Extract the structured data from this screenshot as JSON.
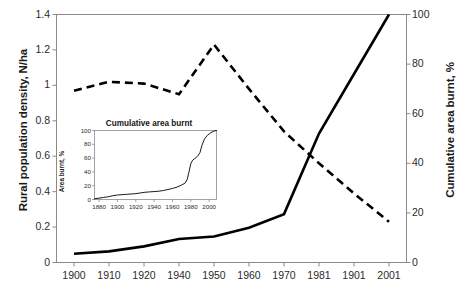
{
  "chart_data": [
    {
      "id": "main",
      "type": "line",
      "title": "",
      "xlabel": "",
      "grid": false,
      "legend": "none",
      "categories": [
        "1900",
        "1910",
        "1920",
        "1940",
        "1950",
        "1960",
        "1970",
        "1981",
        "1901",
        "2001"
      ],
      "axes": {
        "left": {
          "label": "Rural population density, N/ha",
          "ticks": [
            "0",
            "0.2",
            "0.4",
            "0.6",
            "0.8",
            "1",
            "1.2",
            "1.4"
          ],
          "tick_values": [
            0,
            0.2,
            0.4,
            0.6,
            0.8,
            1.0,
            1.2,
            1.4
          ],
          "ylim": [
            0,
            1.4
          ]
        },
        "right": {
          "label": "Cumulative area burnt, %",
          "ticks": [
            "0",
            "20",
            "40",
            "60",
            "80",
            "100"
          ],
          "tick_values": [
            0,
            20,
            40,
            60,
            80,
            100
          ],
          "ylim": [
            0,
            100
          ]
        }
      },
      "series": [
        {
          "name": "Rural population density",
          "axis": "left",
          "style": "dashed",
          "color": "#000000",
          "values": [
            0.97,
            1.02,
            1.01,
            0.95,
            1.23,
            0.98,
            0.74,
            0.56,
            0.39,
            0.23
          ]
        },
        {
          "name": "Cumulative area burnt",
          "axis": "right",
          "style": "solid",
          "color": "#000000",
          "values": [
            3.5,
            4.5,
            6.5,
            9.5,
            10.5,
            14.0,
            19.5,
            52.0,
            76.0,
            100.0
          ]
        }
      ]
    },
    {
      "id": "inset",
      "type": "line",
      "title": "Cumulative area burnt",
      "xlabel": "",
      "grid": false,
      "legend": "none",
      "axes": {
        "left": {
          "label": "Area burnt, %",
          "ticks": [
            "0",
            "20",
            "40",
            "60",
            "80",
            "100"
          ],
          "tick_values": [
            0,
            20,
            40,
            60,
            80,
            100
          ],
          "ylim": [
            0,
            100
          ]
        },
        "bottom": {
          "ticks": [
            "1880",
            "1900",
            "1920",
            "1940",
            "1960",
            "1980",
            "2000"
          ],
          "tick_values": [
            1880,
            1900,
            1920,
            1940,
            1960,
            1980,
            2000
          ],
          "xlim": [
            1875,
            2008
          ]
        }
      },
      "series": [
        {
          "name": "Area burnt",
          "style": "solid",
          "color": "#000000",
          "x": [
            1875,
            1880,
            1885,
            1890,
            1895,
            1900,
            1905,
            1910,
            1915,
            1920,
            1925,
            1930,
            1935,
            1940,
            1945,
            1950,
            1955,
            1960,
            1965,
            1970,
            1974,
            1976,
            1978,
            1980,
            1982,
            1984,
            1986,
            1988,
            1990,
            1992,
            1995,
            1998,
            2000,
            2002,
            2005,
            2008
          ],
          "y": [
            1.0,
            2.0,
            3.0,
            4.0,
            5.5,
            6.5,
            7.0,
            7.5,
            8.0,
            8.5,
            9.5,
            10.5,
            11.0,
            11.5,
            12.0,
            13.0,
            14.5,
            16.0,
            18.0,
            21.0,
            24.0,
            29.0,
            40.0,
            52.0,
            57.0,
            59.0,
            61.0,
            64.0,
            68.0,
            78.0,
            88.0,
            93.0,
            95.0,
            97.0,
            99.0,
            100.0
          ]
        }
      ]
    }
  ]
}
